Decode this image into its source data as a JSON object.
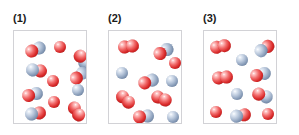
{
  "figure": {
    "title": "",
    "panel_count": 3,
    "colors": {
      "atom_red": "#d92a2a",
      "atom_blue": "#8297b4",
      "box_border": "#d2d2d6",
      "background": "#ffffff",
      "label_text": "#1b1b1b"
    }
  },
  "panels": [
    {
      "label": "(1)",
      "box_left": 13,
      "box_top": 30,
      "box_width": 74,
      "box_height": 94,
      "particles": [
        {
          "kind": "diatomic-red-blue",
          "x": 11,
          "y": 12,
          "angle": -22,
          "size": 13
        },
        {
          "kind": "atom-red",
          "x": 40,
          "y": 10,
          "angle": 0,
          "size": 12
        },
        {
          "kind": "diatomic-red-blue",
          "x": 58,
          "y": 22,
          "angle": 55,
          "size": 13
        },
        {
          "kind": "diatomic-blue-red",
          "x": 12,
          "y": 33,
          "angle": 8,
          "size": 13
        },
        {
          "kind": "diatomic-red-blue",
          "x": 55,
          "y": 38,
          "angle": -40,
          "size": 13
        },
        {
          "kind": "atom-red",
          "x": 33,
          "y": 44,
          "angle": 0,
          "size": 12
        },
        {
          "kind": "diatomic-red-blue",
          "x": 8,
          "y": 57,
          "angle": -14,
          "size": 13
        },
        {
          "kind": "atom-blue",
          "x": 58,
          "y": 53,
          "angle": 0,
          "size": 12
        },
        {
          "kind": "atom-red",
          "x": 34,
          "y": 65,
          "angle": 0,
          "size": 12
        },
        {
          "kind": "diatomic-blue-red",
          "x": 11,
          "y": 76,
          "angle": -8,
          "size": 13
        },
        {
          "kind": "diatomic-red-red",
          "x": 52,
          "y": 74,
          "angle": 58,
          "size": 13
        }
      ]
    },
    {
      "label": "(2)",
      "box_left": 108,
      "box_top": 30,
      "box_width": 74,
      "box_height": 94,
      "particles": [
        {
          "kind": "diatomic-red-red",
          "x": 9,
          "y": 9,
          "angle": -8,
          "size": 13
        },
        {
          "kind": "diatomic-red-blue",
          "x": 44,
          "y": 14,
          "angle": -30,
          "size": 13
        },
        {
          "kind": "atom-red",
          "x": 60,
          "y": 26,
          "angle": 0,
          "size": 12
        },
        {
          "kind": "atom-blue",
          "x": 7,
          "y": 36,
          "angle": 0,
          "size": 12
        },
        {
          "kind": "diatomic-red-blue",
          "x": 29,
          "y": 44,
          "angle": -20,
          "size": 13
        },
        {
          "kind": "atom-blue",
          "x": 57,
          "y": 44,
          "angle": 0,
          "size": 12
        },
        {
          "kind": "diatomic-red-red",
          "x": 6,
          "y": 62,
          "angle": 42,
          "size": 13
        },
        {
          "kind": "diatomic-red-red",
          "x": 42,
          "y": 61,
          "angle": 22,
          "size": 13
        },
        {
          "kind": "diatomic-red-blue",
          "x": 24,
          "y": 79,
          "angle": -6,
          "size": 13
        },
        {
          "kind": "atom-blue",
          "x": 58,
          "y": 80,
          "angle": 0,
          "size": 12
        }
      ]
    },
    {
      "label": "(3)",
      "box_left": 203,
      "box_top": 30,
      "box_width": 74,
      "box_height": 94,
      "particles": [
        {
          "kind": "diatomic-red-red",
          "x": 6,
          "y": 9,
          "angle": -12,
          "size": 13
        },
        {
          "kind": "diatomic-blue-red",
          "x": 50,
          "y": 11,
          "angle": -32,
          "size": 13
        },
        {
          "kind": "atom-blue",
          "x": 32,
          "y": 23,
          "angle": 0,
          "size": 12
        },
        {
          "kind": "diatomic-red-red",
          "x": 8,
          "y": 40,
          "angle": -6,
          "size": 13
        },
        {
          "kind": "diatomic-red-blue",
          "x": 46,
          "y": 37,
          "angle": -16,
          "size": 13
        },
        {
          "kind": "atom-blue",
          "x": 27,
          "y": 57,
          "angle": 0,
          "size": 12
        },
        {
          "kind": "diatomic-red-blue",
          "x": 48,
          "y": 58,
          "angle": 20,
          "size": 13
        },
        {
          "kind": "atom-red",
          "x": 6,
          "y": 75,
          "angle": 0,
          "size": 12
        },
        {
          "kind": "diatomic-blue-red",
          "x": 26,
          "y": 78,
          "angle": -10,
          "size": 13
        },
        {
          "kind": "atom-red",
          "x": 58,
          "y": 77,
          "angle": 0,
          "size": 12
        }
      ]
    }
  ]
}
